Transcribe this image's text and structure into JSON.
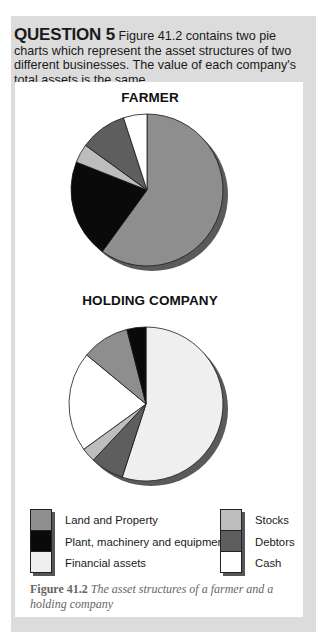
{
  "question": {
    "number": "QUESTION 5",
    "text": "Figure 41.2 contains two pie charts which represent the asset structures of two different businesses. The value of each company's total assets is the same."
  },
  "colors": {
    "land_and_property": "#8e8e8e",
    "plant_machinery_equipment": "#0a0a0a",
    "financial_assets": "#efefef",
    "stocks": "#bdbdbd",
    "debtors": "#5e5e5e",
    "cash": "#ffffff",
    "panel_bg": "#dcdcdc",
    "shadow": "#5a5a5a"
  },
  "legend": {
    "left": [
      {
        "label": "Land and Property",
        "color": "#8e8e8e"
      },
      {
        "label": "Plant, machinery and equipment",
        "color": "#0a0a0a"
      },
      {
        "label": "Financial assets",
        "color": "#efefef"
      }
    ],
    "right": [
      {
        "label": "Stocks",
        "color": "#bdbdbd"
      },
      {
        "label": "Debtors",
        "color": "#5e5e5e"
      },
      {
        "label": "Cash",
        "color": "#ffffff"
      }
    ]
  },
  "caption": {
    "figure_label": "Figure 41.2",
    "text": "The asset structures of a farmer and a holding company"
  },
  "chart_data": [
    {
      "type": "pie",
      "title": "FARMER",
      "categories": [
        "Land and Property",
        "Plant, machinery and equipment",
        "Stocks",
        "Debtors",
        "Cash"
      ],
      "values": [
        60,
        21,
        4,
        10,
        5
      ],
      "unit": "% of total assets (estimated)",
      "start_angle": "12 o'clock, clockwise",
      "legend_position": "bottom"
    },
    {
      "type": "pie",
      "title": "HOLDING COMPANY",
      "categories": [
        "Financial assets",
        "Debtors",
        "Stocks",
        "Cash",
        "Land and Property",
        "Plant, machinery and equipment"
      ],
      "values": [
        55,
        7,
        3,
        21,
        10,
        4
      ],
      "unit": "% of total assets (estimated)",
      "start_angle": "12 o'clock, clockwise",
      "legend_position": "bottom"
    }
  ]
}
